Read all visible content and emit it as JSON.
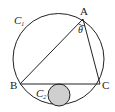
{
  "diagram": {
    "title": "",
    "circle_outer": {
      "label": "C",
      "subscript": "1",
      "center": [
        58.5,
        59
      ],
      "radius": 45.5,
      "stroke": "#222222",
      "fill": "none"
    },
    "circle_inner": {
      "label": "C",
      "subscript": "2",
      "center": [
        59,
        95
      ],
      "radius": 11,
      "stroke": "#222222",
      "fill": "#cfcfcf"
    },
    "points": {
      "A": {
        "label": "A",
        "xy": [
          83,
          19
        ]
      },
      "B": {
        "label": "B",
        "xy": [
          20,
          84
        ]
      },
      "C": {
        "label": "C",
        "xy": [
          100,
          84
        ]
      }
    },
    "segments": [
      "AB",
      "BC",
      "CA"
    ],
    "angle": {
      "vertex": "A",
      "label": "θ"
    },
    "colors": {
      "line": "#222222",
      "inner_fill": "#cfcfcf",
      "background": "#ffffff"
    }
  }
}
